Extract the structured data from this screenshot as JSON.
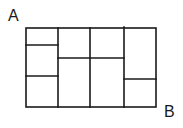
{
  "diagram": {
    "type": "grid-path-puzzle",
    "labels": {
      "start": "A",
      "end": "B"
    },
    "stroke_color": "#1a1a1a",
    "background": "#ffffff",
    "outer_rect": {
      "x1": 26,
      "y1": 28,
      "x2": 156,
      "y2": 107
    },
    "vertical_lines": [
      {
        "x": 58,
        "y1": 28,
        "y2": 107
      },
      {
        "x": 90,
        "y1": 28,
        "y2": 107
      },
      {
        "x": 124,
        "y1": 27,
        "y2": 107
      }
    ],
    "horizontal_lines": [
      {
        "y": 45,
        "x1": 26,
        "x2": 58
      },
      {
        "y": 76,
        "x1": 26,
        "x2": 58
      },
      {
        "y": 58,
        "x1": 58,
        "x2": 124
      },
      {
        "y": 79,
        "x1": 124,
        "x2": 156
      }
    ],
    "cells": [
      {
        "column": 1,
        "rows": 3
      },
      {
        "column": 2,
        "rows": 2
      },
      {
        "column": 3,
        "rows": 2
      },
      {
        "column": 4,
        "rows": 2
      }
    ]
  }
}
